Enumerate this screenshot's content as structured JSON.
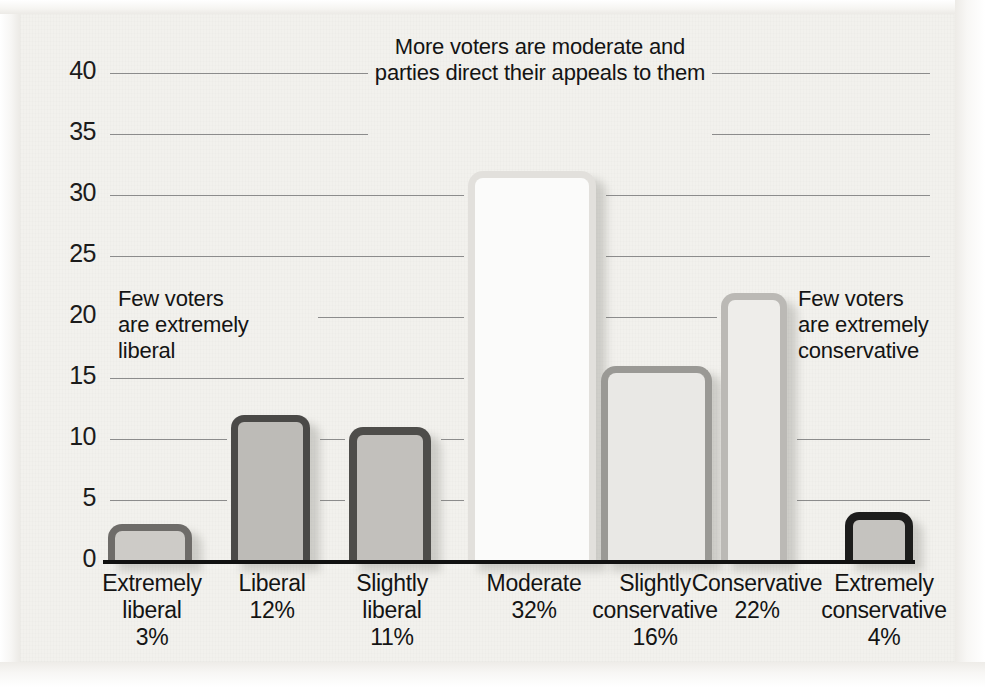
{
  "chart_data": {
    "type": "bar",
    "title": "More voters are moderate and parties direct their appeals to them",
    "title_line1": "More voters are moderate and",
    "title_line2": "parties direct their appeals to them",
    "xlabel": "",
    "ylabel": "",
    "ylim": [
      0,
      40
    ],
    "grid": true,
    "legend": "none",
    "yticks": [
      40,
      35,
      30,
      25,
      20,
      15,
      10,
      5,
      0
    ],
    "categories": [
      "Extremely liberal",
      "Liberal",
      "Slightly liberal",
      "Moderate",
      "Slightly conservative",
      "Conservative",
      "Extremely conservative"
    ],
    "values": [
      3,
      12,
      11,
      32,
      16,
      22,
      4
    ],
    "value_labels": [
      "3%",
      "12%",
      "11%",
      "32%",
      "16%",
      "22%",
      "4%"
    ],
    "annotations": [
      "Few voters are extremely liberal",
      "Few voters are extremely conservative"
    ]
  },
  "ticks": [
    {
      "label": "40",
      "value": 40
    },
    {
      "label": "35",
      "value": 35
    },
    {
      "label": "30",
      "value": 30
    },
    {
      "label": "25",
      "value": 25
    },
    {
      "label": "20",
      "value": 20
    },
    {
      "label": "15",
      "value": 15
    },
    {
      "label": "10",
      "value": 10
    },
    {
      "label": "5",
      "value": 5
    },
    {
      "label": "0",
      "value": 0
    }
  ],
  "bars": [
    {
      "name": "extremely-liberal",
      "line1": "Extremely",
      "line2": "liberal",
      "line3": "3%",
      "value": 3
    },
    {
      "name": "liberal",
      "line1": "Liberal",
      "line2": "12%",
      "line3": "",
      "value": 12
    },
    {
      "name": "slightly-liberal",
      "line1": "Slightly",
      "line2": "liberal",
      "line3": "11%",
      "value": 11
    },
    {
      "name": "moderate",
      "line1": "Moderate",
      "line2": "32%",
      "line3": "",
      "value": 32
    },
    {
      "name": "slightly-conservative",
      "line1": "Slightly",
      "line2": "conservative",
      "line3": "16%",
      "value": 16
    },
    {
      "name": "conservative",
      "line1": "Conservative",
      "line2": "22%",
      "line3": "",
      "value": 22
    },
    {
      "name": "extremely-conservative",
      "line1": "Extremely",
      "line2": "conservative",
      "line3": "4%",
      "value": 4
    }
  ],
  "annotations": {
    "left": {
      "line1": "Few voters",
      "line2": "are extremely",
      "line3": "liberal"
    },
    "right": {
      "line1": "Few voters",
      "line2": "are extremely",
      "line3": "conservative"
    }
  },
  "colors": {
    "page_background": "#f2f1ed",
    "gridline": "#8c8c8c",
    "axis": "#111111",
    "text": "#141414"
  }
}
